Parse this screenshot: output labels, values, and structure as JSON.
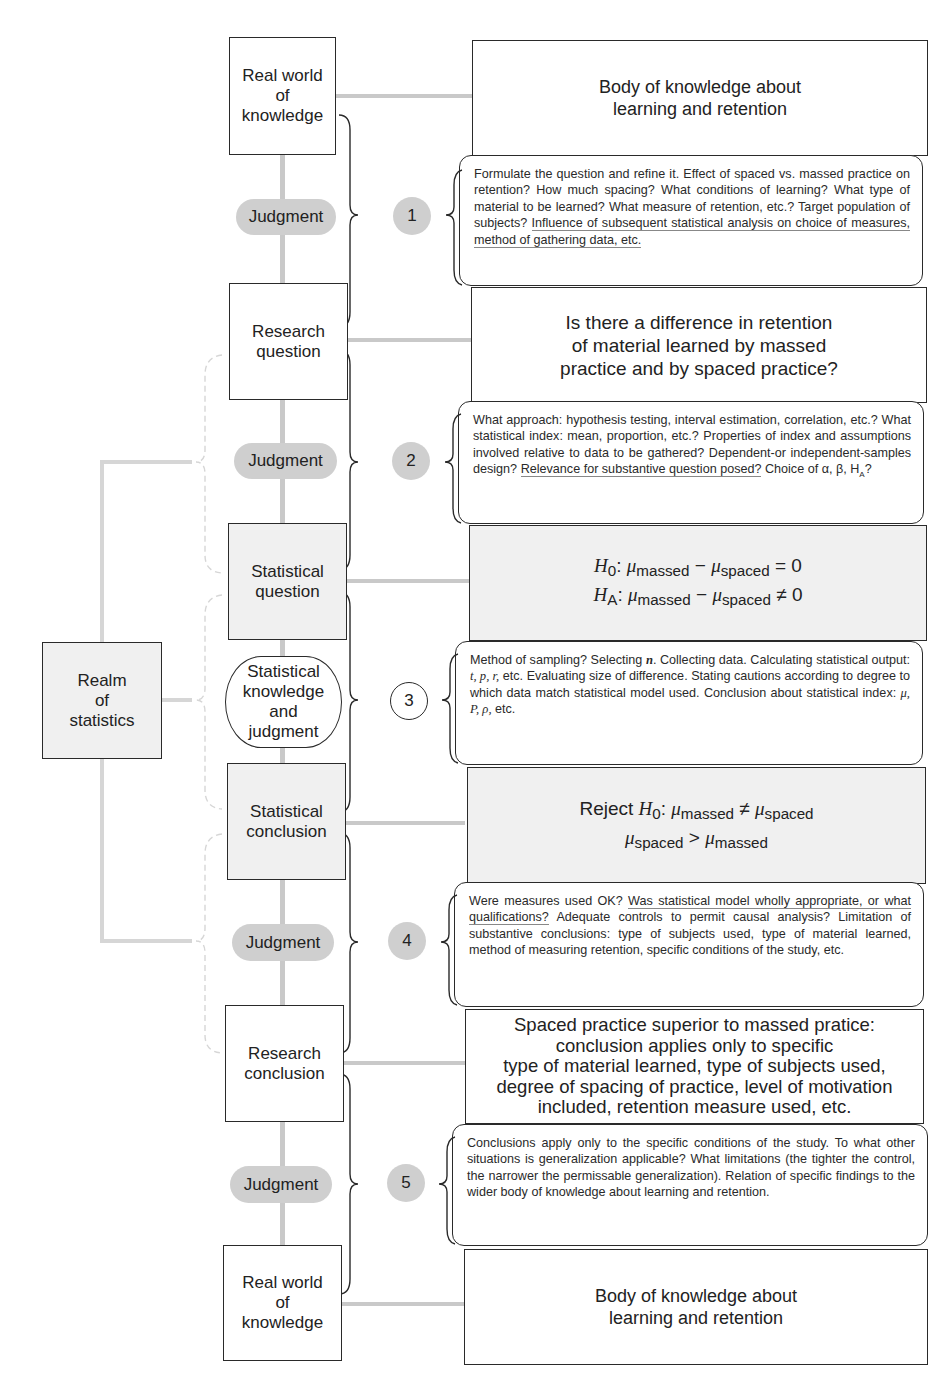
{
  "diagram": {
    "left_column": {
      "nodes": [
        {
          "id": "real-world-top",
          "label": "Real world of knowledge",
          "lines": [
            "Real world",
            "of",
            "knowledge"
          ],
          "shaded": false
        },
        {
          "id": "research-question",
          "label": "Research question",
          "lines": [
            "Research",
            "question"
          ],
          "shaded": false
        },
        {
          "id": "statistical-question",
          "label": "Statistical question",
          "lines": [
            "Statistical",
            "question"
          ],
          "shaded": true
        },
        {
          "id": "statistical-conclusion",
          "label": "Statistical conclusion",
          "lines": [
            "Statistical",
            "conclusion"
          ],
          "shaded": true
        },
        {
          "id": "research-conclusion",
          "label": "Research conclusion",
          "lines": [
            "Research",
            "conclusion"
          ],
          "shaded": false
        },
        {
          "id": "real-world-bottom",
          "label": "Real world of knowledge",
          "lines": [
            "Real world",
            "of",
            "knowledge"
          ],
          "shaded": false
        }
      ],
      "connectors": [
        {
          "label": "Judgment",
          "step": "1"
        },
        {
          "label": "Judgment",
          "step": "2"
        },
        {
          "lines": [
            "Statistical",
            "knowledge",
            "and",
            "judgment"
          ],
          "step": "3"
        },
        {
          "label": "Judgment",
          "step": "4"
        },
        {
          "label": "Judgment",
          "step": "5"
        }
      ]
    },
    "realm": {
      "lines": [
        "Realm",
        "of",
        "statistics"
      ]
    },
    "right_column": {
      "boxes": [
        {
          "lines": [
            "Body of knowledge about",
            "learning and retention"
          ]
        },
        {
          "lines": [
            "Is there a difference in retention",
            "of material learned by massed",
            "practice and by spaced practice?"
          ]
        },
        {
          "h0_label": "H",
          "h0_sub": "0",
          "ha_label": "H",
          "ha_sub": "A",
          "mu": "μ",
          "massed": "massed",
          "spaced": "spaced",
          "minus": "−",
          "eq": "= 0",
          "neq": "≠ 0"
        },
        {
          "reject": "Reject",
          "h0_label": "H",
          "h0_sub": "0",
          "mu": "μ",
          "massed": "massed",
          "spaced": "spaced",
          "neq": "≠",
          "gt": ">"
        },
        {
          "lines": [
            "Spaced practice superior to massed pratice:",
            "conclusion applies only to specific",
            "type of material learned, type of subjects used,",
            "degree of spacing of practice, level of motivation",
            "included, retention measure used, etc."
          ]
        },
        {
          "lines": [
            "Body of knowledge about",
            "learning and retention"
          ]
        }
      ],
      "notes": [
        {
          "step": "1",
          "text": "Formulate the question and refine it. Effect of spaced vs. massed practice on retention? How much spacing? What conditions of learning? What type of material to be learned? What measure of retention, etc.? Target population of subjects?",
          "underlined": "Influence of subsequent statistical analysis on choice of measures, method of gathering data, etc."
        },
        {
          "step": "2",
          "text": "What approach: hypothesis testing, interval estimation, correlation, etc.? What statistical index: mean, proportion, etc.? Properties of index and assumptions involved relative to data to be gathered? Dependent-or independent-samples design?",
          "underlined": "Relevance for substantive question posed?",
          "tail": "Choice of α, β, H",
          "tail_sub": "A",
          "tail_end": "?"
        },
        {
          "step": "3",
          "text_a": "Method of sampling? Selecting ",
          "n": "n",
          "text_b": ". Collecting data. Calculating statistical output: ",
          "tpr": "t, p, r,",
          "text_c": " etc. Evaluating size of difference. Stating cautions according to degree to which data match statistical model used. Conclusion about statistical index: ",
          "idx": "μ, P, ρ,",
          "text_d": " etc."
        },
        {
          "step": "4",
          "lead": "Were measures used OK?",
          "underlined": "Was statistical model wholly appropriate, or what qualifications?",
          "text": "Adequate controls to permit causal analysis? Limitation of substantive conclusions: type of subjects used, type of material learned, method of measuring retention, specific conditions of the study, etc."
        },
        {
          "step": "5",
          "text": "Conclusions apply only to the specific conditions of the study. To what other situations is generalization applicable? What limitations (the tighter the control, the narrower the permissable generalization). Relation of specific findings to the wider body of knowledge about learning and retention."
        }
      ]
    },
    "colors": {
      "line": "#2a2a2a",
      "connector": "#c9c9c9",
      "pill": "#cfcfcf",
      "shade": "#f0f0f0",
      "bracket_light": "#d6d6d6"
    }
  }
}
